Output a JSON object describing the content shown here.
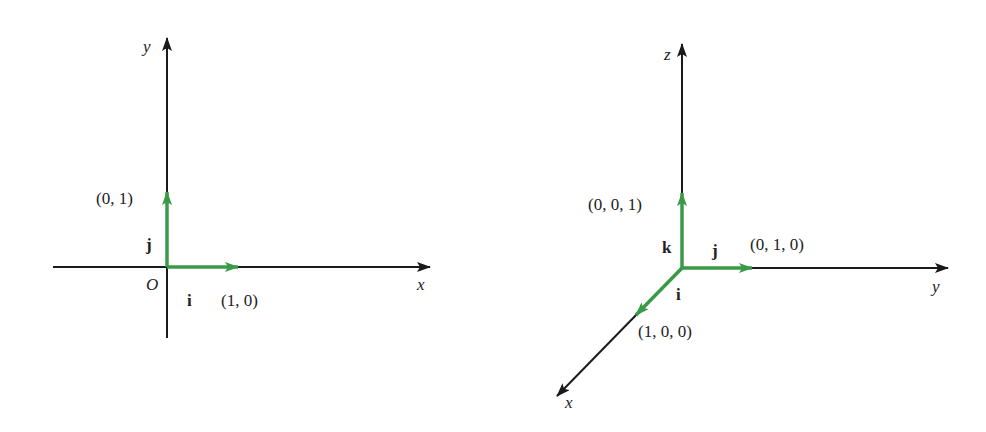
{
  "colors": {
    "axis": "#1a1a1a",
    "vector": "#3a9a48",
    "text": "#222222",
    "background": "#ffffff"
  },
  "diagram_2d": {
    "axis_labels": {
      "x": "x",
      "y": "y"
    },
    "origin_label": "O",
    "vectors": [
      {
        "name": "i",
        "endpoint_label": "(1, 0)"
      },
      {
        "name": "j",
        "endpoint_label": "(0, 1)"
      }
    ]
  },
  "diagram_3d": {
    "axis_labels": {
      "x": "x",
      "y": "y",
      "z": "z"
    },
    "vectors": [
      {
        "name": "i",
        "endpoint_label": "(1, 0, 0)"
      },
      {
        "name": "j",
        "endpoint_label": "(0, 1, 0)"
      },
      {
        "name": "k",
        "endpoint_label": "(0, 0, 1)"
      }
    ]
  }
}
